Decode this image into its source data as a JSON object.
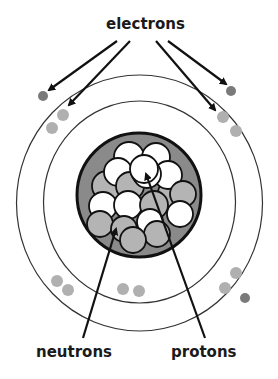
{
  "diagram": {
    "type": "atom-model",
    "labels": {
      "electrons": "electrons",
      "neutrons": "neutrons",
      "protons": "protons"
    },
    "colors": {
      "nucleus_fill": "#8a8a8a",
      "neutron_fill": "#b4b4b4",
      "proton_fill": "#ffffff",
      "electron_outer": "#7a7a7a",
      "electron_inner": "#b0b0b0",
      "stroke": "#111111",
      "orbit": "#333333"
    }
  }
}
